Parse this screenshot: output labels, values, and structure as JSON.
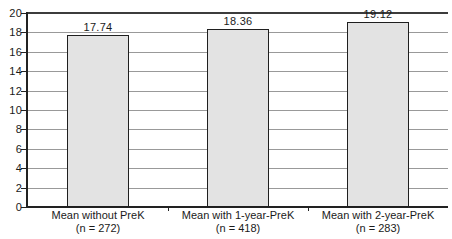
{
  "chart_data": {
    "type": "bar",
    "title": "",
    "xlabel": "",
    "ylabel": "",
    "categories": [
      "Mean without PreK",
      "Mean with 1-year-PreK",
      "Mean with 2-year-PreK"
    ],
    "category_sublabels": [
      "(n = 272)",
      "(n = 418)",
      "(n = 283)"
    ],
    "values": [
      17.74,
      18.36,
      19.12
    ],
    "value_labels": [
      "17.74",
      "18.36",
      "19.12"
    ],
    "ylim": [
      0,
      20
    ],
    "yticks": [
      "0",
      "2",
      "4",
      "6",
      "8",
      "10",
      "12",
      "14",
      "16",
      "18",
      "20"
    ],
    "ytick_values": [
      0,
      2,
      4,
      6,
      8,
      10,
      12,
      14,
      16,
      18,
      20
    ],
    "grid": true,
    "legend": false,
    "colors": {
      "background": "#ffffff",
      "bar_fill": "#e3e3e3",
      "bar_border": "#1f1f1f",
      "gridline": "#999999",
      "top_line": "#3c3c3c",
      "axis": "#222222",
      "text": "#1a1a1a"
    }
  }
}
